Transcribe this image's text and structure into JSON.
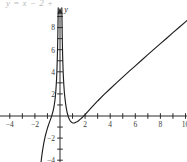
{
  "figure": {
    "caption_formula": "y = x − 2 +",
    "axis_x_label": "x",
    "axis_y_label": "y"
  },
  "chart_data": {
    "type": "line",
    "title": "",
    "xlabel": "x",
    "ylabel": "y",
    "xlim": [
      -4.8,
      11.6
    ],
    "ylim": [
      -4.8,
      9.8
    ],
    "grid": false,
    "legend": null,
    "x_ticks": [
      -4,
      -3,
      -2,
      -1,
      1,
      2,
      3,
      4,
      5,
      6,
      7,
      8,
      9,
      10,
      11
    ],
    "x_tick_labels": [
      {
        "value": -4,
        "label": "−4"
      },
      {
        "value": -2,
        "label": "−2"
      },
      {
        "value": 2,
        "label": "2"
      },
      {
        "value": 4,
        "label": "4"
      },
      {
        "value": 6,
        "label": "6"
      },
      {
        "value": 8,
        "label": "8"
      },
      {
        "value": 10,
        "label": "10"
      }
    ],
    "y_ticks": [
      -4,
      -3,
      -2,
      -1,
      1,
      2,
      3,
      4,
      5,
      6,
      7,
      8,
      9
    ],
    "y_tick_labels": [
      {
        "value": 8,
        "label": "8"
      },
      {
        "value": 6,
        "label": "6"
      },
      {
        "value": 4,
        "label": "4"
      },
      {
        "value": 2,
        "label": "2"
      },
      {
        "value": -2,
        "label": "−2"
      },
      {
        "value": -4,
        "label": "−4"
      }
    ],
    "curve_color": "#1e1e1e",
    "axis_color": "#2b2b2b",
    "vertical_asymptote": 0,
    "series": [
      {
        "name": "left-branch",
        "points": [
          [
            -1.55,
            -4.7
          ],
          [
            -1.5,
            -4.1
          ],
          [
            -1.45,
            -3.6
          ],
          [
            -1.4,
            -3.2
          ],
          [
            -1.35,
            -2.85
          ],
          [
            -1.3,
            -2.5
          ],
          [
            -1.25,
            -2.22
          ],
          [
            -1.2,
            -1.95
          ],
          [
            -1.15,
            -1.72
          ],
          [
            -1.1,
            -1.5
          ],
          [
            -1.05,
            -1.3
          ],
          [
            -1.0,
            -1.1
          ],
          [
            -0.95,
            -0.93
          ],
          [
            -0.9,
            -0.76
          ],
          [
            -0.85,
            -0.6
          ],
          [
            -0.8,
            -0.44
          ],
          [
            -0.75,
            -0.28
          ],
          [
            -0.7,
            -0.12
          ],
          [
            -0.65,
            0.05
          ],
          [
            -0.6,
            0.25
          ],
          [
            -0.55,
            0.47
          ],
          [
            -0.5,
            0.72
          ],
          [
            -0.45,
            1.05
          ],
          [
            -0.4,
            1.45
          ],
          [
            -0.35,
            2.0
          ],
          [
            -0.3,
            2.8
          ],
          [
            -0.27,
            3.4
          ],
          [
            -0.24,
            4.25
          ],
          [
            -0.21,
            5.4
          ],
          [
            -0.19,
            6.35
          ],
          [
            -0.17,
            7.55
          ],
          [
            -0.155,
            8.65
          ],
          [
            -0.145,
            9.5
          ],
          [
            -0.14,
            9.9
          ]
        ]
      },
      {
        "name": "right-branch",
        "points": [
          [
            0.145,
            9.9
          ],
          [
            0.15,
            9.5
          ],
          [
            0.16,
            8.6
          ],
          [
            0.175,
            7.4
          ],
          [
            0.19,
            6.5
          ],
          [
            0.21,
            5.45
          ],
          [
            0.24,
            4.35
          ],
          [
            0.27,
            3.5
          ],
          [
            0.3,
            2.9
          ],
          [
            0.35,
            2.1
          ],
          [
            0.4,
            1.55
          ],
          [
            0.45,
            1.1
          ],
          [
            0.5,
            0.72
          ],
          [
            0.55,
            0.42
          ],
          [
            0.6,
            0.18
          ],
          [
            0.65,
            -0.02
          ],
          [
            0.7,
            -0.18
          ],
          [
            0.75,
            -0.31
          ],
          [
            0.8,
            -0.41
          ],
          [
            0.85,
            -0.49
          ],
          [
            0.9,
            -0.55
          ],
          [
            0.95,
            -0.59
          ],
          [
            1.0,
            -0.62
          ],
          [
            1.05,
            -0.63
          ],
          [
            1.1,
            -0.63
          ],
          [
            1.15,
            -0.62
          ],
          [
            1.2,
            -0.6
          ],
          [
            1.26,
            -0.57
          ],
          [
            1.3,
            -0.55
          ],
          [
            1.4,
            -0.49
          ],
          [
            1.5,
            -0.41
          ],
          [
            1.6,
            -0.31
          ],
          [
            1.8,
            -0.11
          ],
          [
            2.0,
            0.12
          ],
          [
            2.25,
            0.45
          ],
          [
            2.5,
            0.76
          ],
          [
            3.0,
            1.36
          ],
          [
            3.5,
            1.93
          ],
          [
            4.0,
            2.47
          ],
          [
            4.5,
            3.0
          ],
          [
            5.0,
            3.52
          ],
          [
            5.5,
            4.04
          ],
          [
            6.0,
            4.54
          ],
          [
            6.5,
            5.05
          ],
          [
            7.0,
            5.55
          ],
          [
            7.5,
            6.05
          ],
          [
            8.0,
            6.55
          ],
          [
            8.5,
            7.04
          ],
          [
            9.0,
            7.54
          ],
          [
            9.5,
            8.03
          ],
          [
            10.0,
            8.52
          ],
          [
            10.5,
            9.02
          ],
          [
            11.0,
            9.51
          ],
          [
            11.2,
            9.71
          ]
        ]
      }
    ]
  }
}
